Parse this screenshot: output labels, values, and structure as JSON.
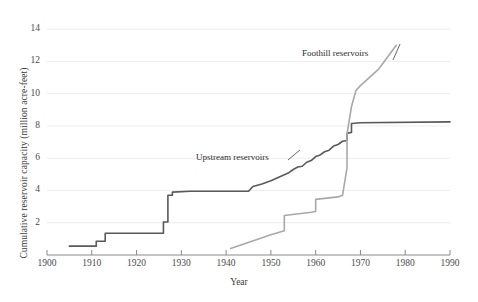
{
  "chart_data": {
    "type": "line",
    "title": "",
    "subtitle": "",
    "xlabel": "Year",
    "ylabel": "Cumulative reservoir capacity (million acre-feet)",
    "xlim": [
      1900,
      1990
    ],
    "ylim": [
      0,
      15
    ],
    "xticks": [
      1900,
      1910,
      1920,
      1930,
      1940,
      1950,
      1960,
      1970,
      1980,
      1990
    ],
    "yticks": [
      2,
      4,
      6,
      8,
      10,
      12,
      14
    ],
    "grid": "horizontal",
    "legend_position": "inline-annotations",
    "annotations": [
      {
        "text": "Upstream reservoirs",
        "x": 1937,
        "y": 5.3
      },
      {
        "text": "Foothill reservoirs",
        "x": 1962,
        "y": 11.8
      }
    ],
    "series": [
      {
        "name": "Upstream reservoirs",
        "color": "#595959",
        "style": "step",
        "points": [
          [
            1905,
            0.55
          ],
          [
            1911,
            0.55
          ],
          [
            1911,
            0.85
          ],
          [
            1913,
            0.85
          ],
          [
            1913,
            1.35
          ],
          [
            1926,
            1.35
          ],
          [
            1926,
            2.05
          ],
          [
            1927,
            2.05
          ],
          [
            1927,
            3.7
          ],
          [
            1928,
            3.7
          ],
          [
            1928,
            3.9
          ],
          [
            1932,
            3.95
          ],
          [
            1945,
            3.95
          ],
          [
            1946,
            4.25
          ],
          [
            1948,
            4.4
          ],
          [
            1950,
            4.6
          ],
          [
            1952,
            4.85
          ],
          [
            1954,
            5.1
          ],
          [
            1955,
            5.3
          ],
          [
            1956,
            5.45
          ],
          [
            1957,
            5.5
          ],
          [
            1958,
            5.75
          ],
          [
            1959,
            5.85
          ],
          [
            1960,
            6.1
          ],
          [
            1961,
            6.2
          ],
          [
            1962,
            6.4
          ],
          [
            1963,
            6.5
          ],
          [
            1964,
            6.75
          ],
          [
            1965,
            6.85
          ],
          [
            1966,
            7.05
          ],
          [
            1967,
            7.1
          ],
          [
            1967,
            7.55
          ],
          [
            1968,
            7.6
          ],
          [
            1968,
            8.15
          ],
          [
            1970,
            8.2
          ],
          [
            1990,
            8.25
          ]
        ]
      },
      {
        "name": "Foothill reservoirs",
        "color": "#a8a8a8",
        "style": "step",
        "points": [
          [
            1941,
            0.4
          ],
          [
            1950,
            1.25
          ],
          [
            1953,
            1.5
          ],
          [
            1953,
            2.45
          ],
          [
            1959,
            2.65
          ],
          [
            1960,
            2.7
          ],
          [
            1960,
            3.45
          ],
          [
            1965,
            3.6
          ],
          [
            1966,
            3.7
          ],
          [
            1967,
            5.4
          ],
          [
            1967,
            7.5
          ],
          [
            1968,
            9.2
          ],
          [
            1969,
            10.2
          ],
          [
            1970,
            10.5
          ],
          [
            1974,
            11.5
          ],
          [
            1978,
            13.0
          ]
        ]
      }
    ]
  }
}
